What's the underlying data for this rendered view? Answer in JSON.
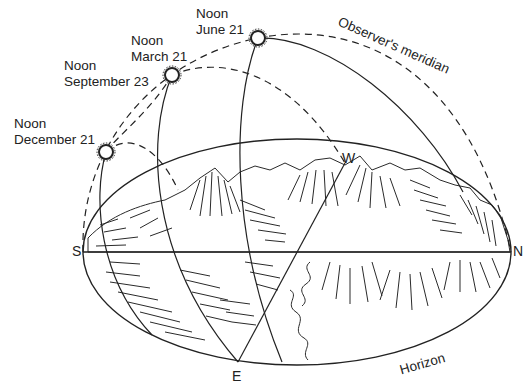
{
  "diagram": {
    "type": "celestial-sun-path",
    "colors": {
      "ink": "#222222",
      "background": "#ffffff"
    },
    "sun_labels": [
      {
        "line1": "Noon",
        "line2": "June 21"
      },
      {
        "line1": "Noon",
        "line2": "March 21"
      },
      {
        "line1": "Noon",
        "line2": "September 23"
      },
      {
        "line1": "Noon",
        "line2": "December 21"
      }
    ],
    "meridian_label": "Observer's meridian",
    "horizon_label": "Horizon",
    "cardinals": {
      "south": "S",
      "north": "N",
      "east": "E",
      "west": "W"
    },
    "icons": [
      "sun-icon",
      "sun-icon",
      "sun-icon"
    ]
  }
}
